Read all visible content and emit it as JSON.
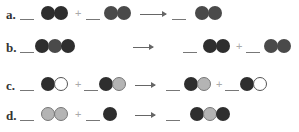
{
  "reactions": [
    {
      "label": "a.",
      "reactants": [
        [
          "dark",
          "dark"
        ],
        [
          "mid",
          "mid"
        ]
      ],
      "products": [
        [
          "mid",
          "dark"
        ]
      ]
    },
    {
      "label": "b.",
      "reactants": [
        [
          "dark",
          "mid",
          "dark"
        ]
      ],
      "products": [
        [
          "dark",
          "dark"
        ],
        [
          "mid",
          "mid"
        ]
      ]
    },
    {
      "label": "c.",
      "reactants": [
        [
          "dark",
          "white"
        ],
        [
          "dark",
          "light"
        ]
      ],
      "products": [
        [
          "dark",
          "light"
        ],
        [
          "dark",
          "white"
        ]
      ]
    },
    {
      "label": "d.",
      "reactants": [
        [
          "light",
          "light"
        ],
        [
          "dark"
        ]
      ],
      "products": [
        [
          "dark",
          "light",
          "dark"
        ]
      ]
    }
  ],
  "symbols": {
    "plus": "+"
  }
}
